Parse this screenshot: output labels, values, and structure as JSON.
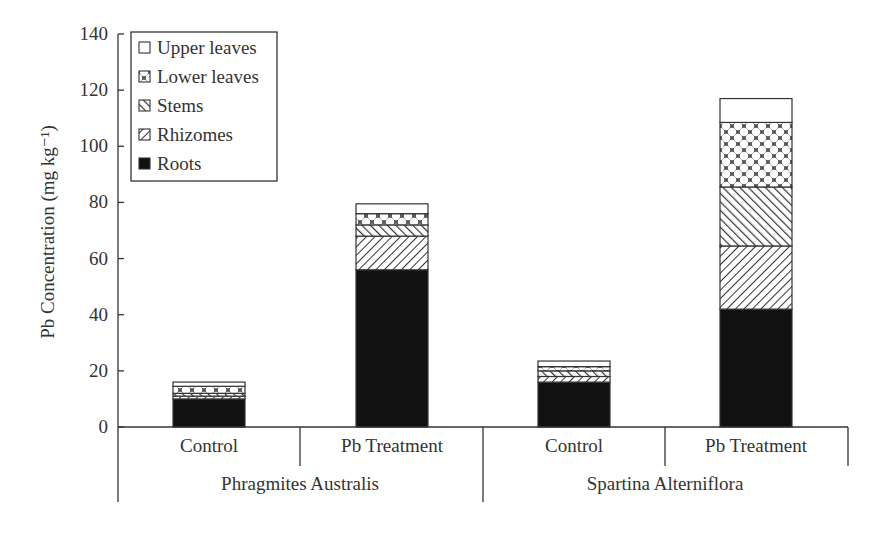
{
  "chart_data": {
    "type": "bar",
    "stacked": true,
    "title": "",
    "xlabel": "",
    "ylabel": "Pb Concentration (mg kg⁻¹)",
    "ylim": [
      0,
      140
    ],
    "yticks": [
      0,
      20,
      40,
      60,
      80,
      100,
      120,
      140
    ],
    "grid": false,
    "legend_position": "upper left (inside)",
    "categories": [
      "Control",
      "Pb Treatment",
      "Control",
      "Pb Treatment"
    ],
    "groups": [
      {
        "label": "Phragmites Australis",
        "categories": [
          "Control",
          "Pb Treatment"
        ]
      },
      {
        "label": "Spartina Alterniflora",
        "categories": [
          "Control",
          "Pb Treatment"
        ]
      }
    ],
    "series": [
      {
        "name": "Roots",
        "pattern": "solid-black",
        "values": [
          10,
          56,
          16,
          42
        ]
      },
      {
        "name": "Rhizomes",
        "pattern": "diagonal-forward",
        "values": [
          1,
          12,
          2,
          22.5
        ]
      },
      {
        "name": "Stems",
        "pattern": "diagonal-backward",
        "values": [
          1,
          4,
          2,
          21
        ]
      },
      {
        "name": "Lower leaves",
        "pattern": "crosshatch",
        "values": [
          2.5,
          4,
          1.5,
          23
        ]
      },
      {
        "name": "Upper leaves",
        "pattern": "white",
        "values": [
          1.5,
          3.5,
          2,
          8.5
        ]
      }
    ],
    "totals": [
      16,
      79.5,
      23.5,
      117
    ]
  },
  "legend": {
    "items": [
      {
        "label": "Upper leaves"
      },
      {
        "label": "Lower leaves"
      },
      {
        "label": "Stems"
      },
      {
        "label": "Rhizomes"
      },
      {
        "label": "Roots"
      }
    ]
  },
  "colors": {
    "ink": "#222222",
    "axis": "#333333",
    "background": "#ffffff"
  }
}
